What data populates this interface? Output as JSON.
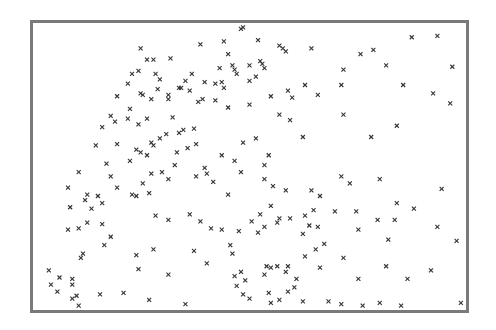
{
  "chart_data": {
    "type": "scatter",
    "title": "",
    "xlabel": "",
    "ylabel": "",
    "xlim": [
      0,
      100
    ],
    "ylim": [
      0,
      100
    ],
    "grid": false,
    "legend": null,
    "marker": "x",
    "marker_color": "#333333",
    "frame_color": "#7a7a7a",
    "series": [
      {
        "name": "points",
        "points": [
          [
            48.5,
            99.5
          ],
          [
            48.0,
            99.0
          ],
          [
            38.5,
            93.5
          ],
          [
            44.0,
            94.5
          ],
          [
            52.0,
            95.0
          ],
          [
            57.0,
            93.0
          ],
          [
            57.8,
            92.0
          ],
          [
            58.5,
            91.0
          ],
          [
            64.5,
            92.0
          ],
          [
            79.0,
            91.5
          ],
          [
            88.0,
            96.0
          ],
          [
            82.0,
            86.0
          ],
          [
            94.0,
            96.5
          ],
          [
            97.5,
            85.5
          ],
          [
            76.0,
            90.0
          ],
          [
            72.0,
            84.5
          ],
          [
            45.0,
            90.0
          ],
          [
            43.0,
            85.0
          ],
          [
            39.5,
            80.0
          ],
          [
            36.5,
            83.0
          ],
          [
            46.0,
            86.0
          ],
          [
            46.5,
            84.5
          ],
          [
            47.0,
            83.0
          ],
          [
            50.0,
            86.0
          ],
          [
            51.5,
            82.0
          ],
          [
            36.0,
            77.0
          ],
          [
            39.0,
            74.0
          ],
          [
            31.0,
            74.0
          ],
          [
            34.0,
            78.0
          ],
          [
            28.0,
            83.0
          ],
          [
            26.0,
            88.0
          ],
          [
            24.5,
            92.0
          ],
          [
            31.5,
            88.5
          ],
          [
            29.0,
            81.0
          ],
          [
            52.5,
            87.5
          ],
          [
            53.0,
            86.5
          ],
          [
            53.5,
            85.0
          ],
          [
            50.0,
            80.5
          ],
          [
            43.5,
            80.0
          ],
          [
            44.0,
            78.0
          ],
          [
            42.0,
            79.5
          ],
          [
            35.0,
            80.5
          ],
          [
            33.5,
            78.0
          ],
          [
            31.0,
            75.5
          ],
          [
            28.5,
            77.5
          ],
          [
            27.0,
            74.0
          ],
          [
            25.0,
            75.5
          ],
          [
            24.5,
            76.0
          ],
          [
            22.0,
            70.5
          ],
          [
            19.0,
            75.0
          ],
          [
            21.5,
            79.5
          ],
          [
            22.5,
            83.0
          ],
          [
            24.0,
            84.0
          ],
          [
            27.5,
            88.0
          ],
          [
            17.5,
            68.0
          ],
          [
            15.5,
            64.0
          ],
          [
            18.5,
            66.0
          ],
          [
            21.5,
            67.0
          ],
          [
            24.0,
            65.0
          ],
          [
            26.0,
            67.0
          ],
          [
            32.0,
            67.5
          ],
          [
            30.5,
            61.5
          ],
          [
            34.5,
            63.0
          ],
          [
            37.0,
            63.5
          ],
          [
            38.0,
            73.0
          ],
          [
            50.0,
            72.0
          ],
          [
            57.0,
            68.5
          ],
          [
            59.5,
            66.5
          ],
          [
            60.0,
            74.5
          ],
          [
            66.0,
            75.5
          ],
          [
            72.0,
            68.5
          ],
          [
            78.5,
            60.5
          ],
          [
            84.5,
            64.5
          ],
          [
            97.0,
            72.5
          ],
          [
            93.0,
            76.0
          ],
          [
            86.0,
            79.0
          ],
          [
            71.5,
            79.0
          ],
          [
            63.0,
            79.0
          ],
          [
            59.0,
            77.0
          ],
          [
            55.0,
            75.0
          ],
          [
            45.0,
            71.0
          ],
          [
            42.0,
            73.5
          ],
          [
            33.5,
            62.0
          ],
          [
            29.0,
            60.0
          ],
          [
            27.0,
            58.5
          ],
          [
            19.0,
            58.0
          ],
          [
            14.0,
            57.5
          ],
          [
            23.5,
            56.0
          ],
          [
            24.5,
            55.0
          ],
          [
            26.0,
            54.0
          ],
          [
            27.5,
            57.5
          ],
          [
            33.0,
            55.0
          ],
          [
            35.5,
            56.5
          ],
          [
            37.5,
            58.0
          ],
          [
            43.5,
            54.0
          ],
          [
            48.5,
            58.5
          ],
          [
            54.5,
            54.0
          ],
          [
            51.5,
            60.0
          ],
          [
            62.5,
            60.5
          ],
          [
            53.5,
            50.5
          ],
          [
            48.0,
            48.0
          ],
          [
            46.5,
            52.0
          ],
          [
            40.0,
            47.5
          ],
          [
            41.5,
            44.5
          ],
          [
            32.5,
            50.5
          ],
          [
            31.0,
            45.5
          ],
          [
            27.0,
            47.5
          ],
          [
            22.0,
            52.0
          ],
          [
            16.5,
            51.0
          ],
          [
            10.0,
            48.0
          ],
          [
            7.5,
            42.5
          ],
          [
            11.5,
            38.0
          ],
          [
            17.5,
            46.5
          ],
          [
            19.0,
            42.5
          ],
          [
            22.5,
            40.0
          ],
          [
            23.5,
            39.5
          ],
          [
            25.0,
            44.0
          ],
          [
            26.5,
            40.5
          ],
          [
            29.5,
            48.0
          ],
          [
            37.5,
            46.5
          ],
          [
            39.5,
            49.5
          ],
          [
            45.0,
            40.0
          ],
          [
            53.5,
            45.5
          ],
          [
            55.5,
            43.0
          ],
          [
            55.0,
            36.0
          ],
          [
            58.5,
            41.5
          ],
          [
            64.5,
            41.5
          ],
          [
            65.0,
            34.5
          ],
          [
            66.5,
            39.5
          ],
          [
            71.5,
            46.5
          ],
          [
            73.5,
            44.0
          ],
          [
            80.5,
            45.5
          ],
          [
            84.5,
            37.0
          ],
          [
            88.5,
            35.0
          ],
          [
            95.0,
            42.0
          ],
          [
            84.0,
            31.0
          ],
          [
            80.0,
            31.0
          ],
          [
            70.0,
            34.0
          ],
          [
            63.0,
            32.5
          ],
          [
            59.5,
            31.5
          ],
          [
            57.0,
            31.5
          ],
          [
            56.5,
            30.0
          ],
          [
            52.5,
            33.0
          ],
          [
            53.5,
            28.5
          ],
          [
            52.0,
            26.5
          ],
          [
            50.5,
            30.5
          ],
          [
            47.5,
            27.0
          ],
          [
            43.5,
            27.5
          ],
          [
            38.5,
            30.5
          ],
          [
            36.0,
            33.0
          ],
          [
            31.0,
            31.0
          ],
          [
            28.0,
            32.5
          ],
          [
            27.5,
            20.5
          ],
          [
            23.5,
            18.5
          ],
          [
            16.0,
            22.0
          ],
          [
            13.0,
            35.0
          ],
          [
            15.5,
            37.0
          ],
          [
            14.5,
            39.5
          ],
          [
            12.0,
            40.0
          ],
          [
            8.0,
            35.5
          ],
          [
            7.5,
            27.5
          ],
          [
            10.0,
            28.0
          ],
          [
            12.0,
            30.0
          ],
          [
            17.5,
            25.0
          ],
          [
            15.5,
            29.5
          ],
          [
            11.0,
            19.0
          ],
          [
            10.5,
            17.5
          ],
          [
            3.0,
            13.0
          ],
          [
            3.5,
            8.0
          ],
          [
            5.0,
            5.5
          ],
          [
            5.5,
            10.5
          ],
          [
            8.5,
            8.0
          ],
          [
            8.5,
            3.0
          ],
          [
            9.5,
            4.0
          ],
          [
            8.5,
            10.0
          ],
          [
            15.0,
            4.5
          ],
          [
            10.0,
            0.5
          ],
          [
            20.5,
            5.0
          ],
          [
            24.0,
            13.5
          ],
          [
            26.5,
            2.5
          ],
          [
            31.0,
            11.5
          ],
          [
            35.0,
            1.0
          ],
          [
            40.0,
            15.5
          ],
          [
            37.0,
            20.0
          ],
          [
            41.0,
            28.0
          ],
          [
            46.0,
            19.0
          ],
          [
            45.5,
            22.0
          ],
          [
            46.5,
            11.0
          ],
          [
            47.0,
            7.5
          ],
          [
            48.0,
            12.5
          ],
          [
            48.5,
            4.5
          ],
          [
            50.0,
            3.0
          ],
          [
            49.0,
            9.5
          ],
          [
            53.5,
            11.5
          ],
          [
            54.0,
            14.5
          ],
          [
            55.0,
            14.0
          ],
          [
            56.5,
            14.5
          ],
          [
            58.5,
            12.5
          ],
          [
            59.0,
            14.5
          ],
          [
            61.0,
            10.0
          ],
          [
            59.0,
            5.5
          ],
          [
            62.5,
            2.0
          ],
          [
            60.5,
            7.0
          ],
          [
            57.0,
            2.5
          ],
          [
            55.0,
            1.5
          ],
          [
            54.5,
            5.0
          ],
          [
            63.0,
            18.0
          ],
          [
            65.5,
            20.5
          ],
          [
            67.5,
            22.5
          ],
          [
            66.0,
            28.5
          ],
          [
            64.0,
            29.0
          ],
          [
            62.5,
            26.0
          ],
          [
            66.5,
            14.0
          ],
          [
            72.0,
            17.5
          ],
          [
            75.5,
            27.5
          ],
          [
            75.0,
            34.0
          ],
          [
            75.5,
            10.0
          ],
          [
            68.5,
            2.0
          ],
          [
            71.5,
            1.0
          ],
          [
            76.5,
            0.5
          ],
          [
            80.5,
            1.5
          ],
          [
            85.5,
            0.5
          ],
          [
            87.0,
            10.0
          ],
          [
            82.0,
            14.5
          ],
          [
            92.5,
            13.0
          ],
          [
            99.5,
            1.5
          ],
          [
            98.5,
            23.5
          ],
          [
            94.0,
            28.5
          ],
          [
            82.5,
            24.0
          ]
        ]
      }
    ]
  }
}
